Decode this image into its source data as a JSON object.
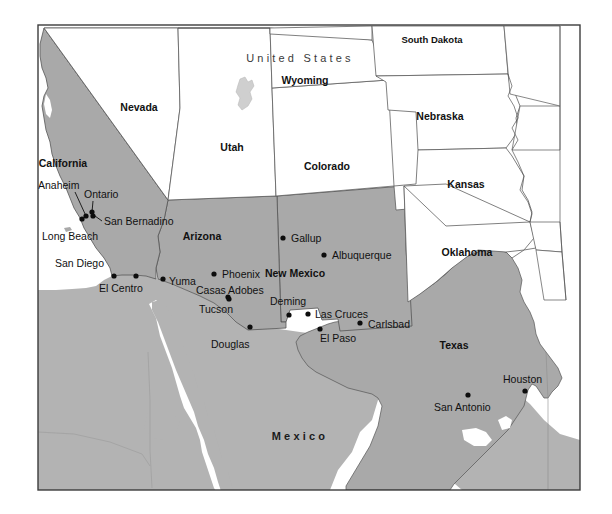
{
  "map": {
    "title": "Southwestern United States and Northern Mexico Reference Map",
    "colors": {
      "highlight_state_fill": "#a9a9a9",
      "plain_state_fill": "#ffffff",
      "mexico_fill": "#b3b3b3",
      "water_fill": "#ffffff",
      "border_stroke": "#555555",
      "frame_stroke": "#3d3d3d",
      "city_dot": "#0d0d0d",
      "label_text": "#111111",
      "country_label_text": "#3a3a3a"
    },
    "frame": {
      "x": 38,
      "y": 25,
      "width": 542,
      "height": 465
    },
    "countries": [
      {
        "name": "United States",
        "label": "U n i t e d   S t a t e s",
        "text": "United States",
        "x": 300,
        "y": 62,
        "style": "country"
      },
      {
        "name": "Mexico",
        "label": "M e x i c o",
        "text": "Mexico",
        "x": 300,
        "y": 440,
        "style": "country-bold"
      }
    ],
    "states": [
      {
        "name": "California",
        "label": "California",
        "x": 63,
        "y": 167,
        "highlighted": true
      },
      {
        "name": "Nevada",
        "label": "Nevada",
        "x": 139,
        "y": 111,
        "highlighted": false
      },
      {
        "name": "Utah",
        "label": "Utah",
        "x": 232,
        "y": 151,
        "highlighted": false
      },
      {
        "name": "Arizona",
        "label": "Arizona",
        "x": 202,
        "y": 240,
        "highlighted": true
      },
      {
        "name": "New Mexico",
        "label": "New Mexico",
        "x": 295,
        "y": 277,
        "highlighted": true
      },
      {
        "name": "Colorado",
        "label": "Colorado",
        "x": 327,
        "y": 170,
        "highlighted": false
      },
      {
        "name": "Wyoming",
        "label": "Wyoming",
        "x": 305,
        "y": 84,
        "highlighted": false
      },
      {
        "name": "South Dakota",
        "label": "South Dakota",
        "x": 432,
        "y": 43,
        "highlighted": false
      },
      {
        "name": "Nebraska",
        "label": "Nebraska",
        "x": 440,
        "y": 120,
        "highlighted": false
      },
      {
        "name": "Kansas",
        "label": "Kansas",
        "x": 466,
        "y": 188,
        "highlighted": false
      },
      {
        "name": "Oklahoma",
        "label": "Oklahoma",
        "x": 467,
        "y": 256,
        "highlighted": false
      },
      {
        "name": "Texas",
        "label": "Texas",
        "x": 454,
        "y": 349,
        "highlighted": true
      }
    ],
    "cities": [
      {
        "name": "Anaheim",
        "label": "Anaheim",
        "dot_x": 86,
        "dot_y": 216,
        "label_x": 38,
        "label_y": 189,
        "anchor": "start",
        "leader": true,
        "leader_path": "M 75 192 L 86 216"
      },
      {
        "name": "Ontario",
        "label": "Ontario",
        "dot_x": 92,
        "dot_y": 212,
        "label_x": 84,
        "label_y": 198,
        "anchor": "start",
        "leader": true,
        "leader_path": "M 93 201 L 92 212"
      },
      {
        "name": "Long Beach",
        "label": "Long Beach",
        "dot_x": 82,
        "dot_y": 219,
        "label_x": 42,
        "label_y": 240,
        "anchor": "start",
        "leader": false,
        "leader_path": ""
      },
      {
        "name": "San Bernadino",
        "label": "San Bernadino",
        "dot_x": 93,
        "dot_y": 216,
        "label_x": 104,
        "label_y": 225,
        "anchor": "start",
        "leader": true,
        "leader_path": "M 95 216 L 102 221"
      },
      {
        "name": "San Diego",
        "label": "San Diego",
        "dot_x": 114,
        "dot_y": 276,
        "label_x": 55,
        "label_y": 267,
        "anchor": "start",
        "leader": false,
        "leader_path": ""
      },
      {
        "name": "El Centro",
        "label": "El Centro",
        "dot_x": 136,
        "dot_y": 276,
        "label_x": 99,
        "label_y": 292,
        "anchor": "start",
        "leader": false,
        "leader_path": ""
      },
      {
        "name": "Yuma",
        "label": "Yuma",
        "dot_x": 163,
        "dot_y": 279,
        "label_x": 169,
        "label_y": 285,
        "anchor": "start",
        "leader": false,
        "leader_path": ""
      },
      {
        "name": "Phoenix",
        "label": "Phoenix",
        "dot_x": 214,
        "dot_y": 274,
        "label_x": 222,
        "label_y": 278,
        "anchor": "start",
        "leader": false,
        "leader_path": ""
      },
      {
        "name": "Casas Adobes",
        "label": "Casas Adobes",
        "dot_x": 228,
        "dot_y": 297,
        "label_x": 196,
        "label_y": 294,
        "anchor": "start",
        "leader": false,
        "leader_path": ""
      },
      {
        "name": "Tucson",
        "label": "Tucson",
        "dot_x": 229,
        "dot_y": 299,
        "label_x": 199,
        "label_y": 313,
        "anchor": "start",
        "leader": false,
        "leader_path": ""
      },
      {
        "name": "Douglas",
        "label": "Douglas",
        "dot_x": 250,
        "dot_y": 327,
        "label_x": 211,
        "label_y": 348,
        "anchor": "start",
        "leader": false,
        "leader_path": ""
      },
      {
        "name": "Gallup",
        "label": "Gallup",
        "dot_x": 283,
        "dot_y": 238,
        "label_x": 291,
        "label_y": 242,
        "anchor": "start",
        "leader": false,
        "leader_path": ""
      },
      {
        "name": "Albuquerque",
        "label": "Albuquerque",
        "dot_x": 324,
        "dot_y": 255,
        "label_x": 332,
        "label_y": 259,
        "anchor": "start",
        "leader": false,
        "leader_path": ""
      },
      {
        "name": "Deming",
        "label": "Deming",
        "dot_x": 289,
        "dot_y": 315,
        "label_x": 270,
        "label_y": 305,
        "anchor": "start",
        "leader": false,
        "leader_path": ""
      },
      {
        "name": "Las Cruces",
        "label": "Las Cruces",
        "dot_x": 308,
        "dot_y": 314,
        "label_x": 315,
        "label_y": 318,
        "anchor": "start",
        "leader": false,
        "leader_path": ""
      },
      {
        "name": "Carlsbad",
        "label": "Carlsbad",
        "dot_x": 360,
        "dot_y": 323,
        "label_x": 368,
        "label_y": 328,
        "anchor": "start",
        "leader": false,
        "leader_path": ""
      },
      {
        "name": "El Paso",
        "label": "El Paso",
        "dot_x": 320,
        "dot_y": 329,
        "label_x": 320,
        "label_y": 342,
        "anchor": "start",
        "leader": false,
        "leader_path": ""
      },
      {
        "name": "Houston",
        "label": "Houston",
        "dot_x": 525,
        "dot_y": 391,
        "label_x": 503,
        "label_y": 383,
        "anchor": "start",
        "leader": false,
        "leader_path": ""
      },
      {
        "name": "San Antonio",
        "label": "San Antonio",
        "dot_x": 468,
        "dot_y": 395,
        "label_x": 434,
        "label_y": 411,
        "anchor": "start",
        "leader": false,
        "leader_path": ""
      }
    ],
    "water_bodies": [
      {
        "name": "Great Salt Lake"
      },
      {
        "name": "Gulf of California"
      },
      {
        "name": "Gulf of Mexico"
      }
    ]
  }
}
